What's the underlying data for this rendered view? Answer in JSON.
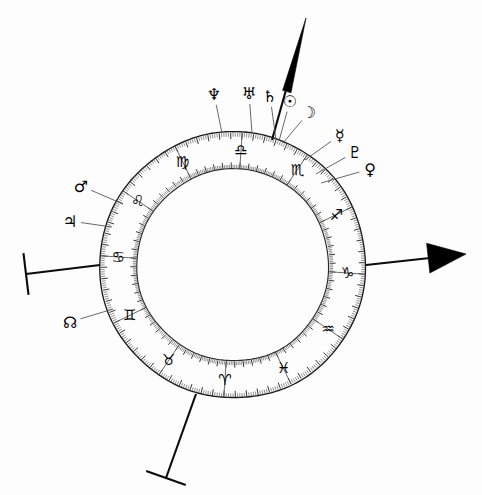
{
  "chart_data": {
    "type": "pie",
    "subtitle": "Hand-drawn zodiac wheel with planetary placements",
    "center": {
      "x": 233,
      "y": 265
    },
    "radii": {
      "outer": 133,
      "inner": 96,
      "glyph": 115
    },
    "ring_rotation_deg": 4,
    "grid": false,
    "legend": "none",
    "categories": [
      "Aries",
      "Taurus",
      "Gemini",
      "Cancer",
      "Leo",
      "Virgo",
      "Libra",
      "Scorpio",
      "Sagittarius",
      "Capricorn",
      "Aquarius",
      "Pisces"
    ],
    "values": [
      30,
      30,
      30,
      30,
      30,
      30,
      30,
      30,
      30,
      30,
      30,
      30
    ],
    "xlabel": "",
    "ylabel": "",
    "tick_subdivisions_per_sector": 30
  },
  "wheel": {
    "label": "zodiac-wheel",
    "signs": [
      {
        "name": "Aries",
        "glyph": "♈",
        "angle_deg": 184,
        "abbrev": "Ari"
      },
      {
        "name": "Taurus",
        "glyph": "♉",
        "angle_deg": 214,
        "abbrev": "Tau"
      },
      {
        "name": "Gemini",
        "glyph": "♊",
        "angle_deg": 244,
        "abbrev": "Gem"
      },
      {
        "name": "Cancer",
        "glyph": "♋",
        "angle_deg": 274,
        "abbrev": "Can"
      },
      {
        "name": "Leo",
        "glyph": "♌",
        "angle_deg": 304,
        "abbrev": "Leo"
      },
      {
        "name": "Virgo",
        "glyph": "♍",
        "angle_deg": 334,
        "abbrev": "Vir"
      },
      {
        "name": "Libra",
        "glyph": "♎",
        "angle_deg": 4,
        "abbrev": "Lib"
      },
      {
        "name": "Scorpio",
        "glyph": "♏",
        "angle_deg": 34,
        "abbrev": "Sco"
      },
      {
        "name": "Sagittarius",
        "glyph": "♐",
        "angle_deg": 64,
        "abbrev": "Sag"
      },
      {
        "name": "Capricorn",
        "glyph": "♑",
        "angle_deg": 94,
        "abbrev": "Cap"
      },
      {
        "name": "Aquarius",
        "glyph": "♒",
        "angle_deg": 124,
        "abbrev": "Aqu"
      },
      {
        "name": "Pisces",
        "glyph": "♓",
        "angle_deg": 154,
        "abbrev": "Pis"
      }
    ]
  },
  "planets": [
    {
      "name": "Neptune",
      "glyph": "♆",
      "label_x": 214,
      "label_y": 94,
      "tip_x": 222,
      "tip_y": 133,
      "has_pointer": true
    },
    {
      "name": "Uranus",
      "glyph": "♅",
      "label_x": 249,
      "label_y": 93,
      "tip_x": 252,
      "tip_y": 133,
      "has_pointer": true
    },
    {
      "name": "Saturn",
      "glyph": "♄",
      "label_x": 270,
      "label_y": 96,
      "tip_x": 276,
      "tip_y": 140,
      "has_pointer": true
    },
    {
      "name": "Sun",
      "glyph": "☉",
      "label_x": 290,
      "label_y": 101,
      "tip_x": 279,
      "tip_y": 141,
      "has_pointer": true
    },
    {
      "name": "Moon",
      "glyph": "☽",
      "label_x": 309,
      "label_y": 112,
      "tip_x": 283,
      "tip_y": 143,
      "has_pointer": true
    },
    {
      "name": "Mercury",
      "glyph": "☿",
      "label_x": 340,
      "label_y": 135,
      "tip_x": 305,
      "tip_y": 160,
      "has_pointer": true
    },
    {
      "name": "Pluto",
      "glyph": "♇",
      "label_x": 355,
      "label_y": 152,
      "tip_x": 316,
      "tip_y": 174,
      "has_pointer": true
    },
    {
      "name": "Venus",
      "glyph": "♀",
      "label_x": 370,
      "label_y": 169,
      "tip_x": 321,
      "tip_y": 183,
      "has_pointer": true
    },
    {
      "name": "Mars",
      "glyph": "♂",
      "label_x": 81,
      "label_y": 186,
      "tip_x": 123,
      "tip_y": 204,
      "has_pointer": true
    },
    {
      "name": "Jupiter",
      "glyph": "♃",
      "label_x": 70,
      "label_y": 221,
      "tip_x": 112,
      "tip_y": 227,
      "has_pointer": true
    },
    {
      "name": "North Node",
      "glyph": "☊",
      "label_x": 70,
      "label_y": 322,
      "tip_x": 113,
      "tip_y": 309,
      "has_pointer": true
    }
  ],
  "axes": [
    {
      "name": "Midheaven",
      "abbrev": "MC",
      "type": "spike-arrow",
      "from_x": 272,
      "from_y": 140,
      "to_x": 306,
      "to_y": 18
    },
    {
      "name": "Descendant",
      "abbrev": "DSC",
      "type": "triangle-arrow",
      "from_x": 366,
      "from_y": 265,
      "to_x": 466,
      "to_y": 254
    },
    {
      "name": "Ascendant",
      "abbrev": "ASC",
      "type": "bar-cap",
      "from_x": 100,
      "from_y": 265,
      "to_x": 26,
      "to_y": 274
    },
    {
      "name": "Imum Coeli",
      "abbrev": "IC",
      "type": "bar-cap",
      "from_x": 196,
      "from_y": 394,
      "to_x": 166,
      "to_y": 478
    }
  ]
}
